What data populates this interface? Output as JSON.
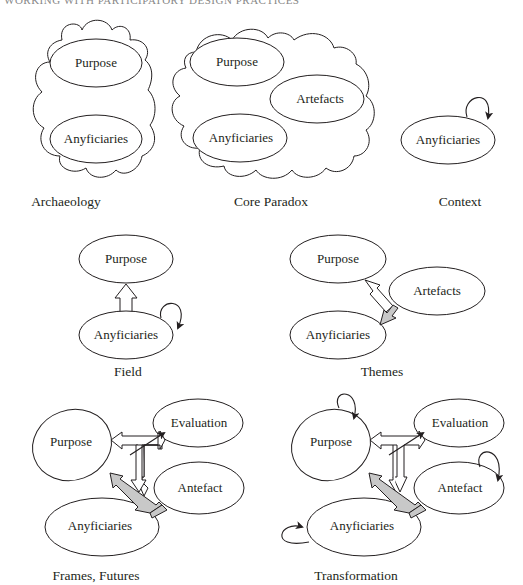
{
  "header": {
    "text": "WORKING WITH PARTICIPATORY DESIGN PRACTICES"
  },
  "diagrams": [
    {
      "id": "archaeology",
      "caption": "Archaeology",
      "nodes": [
        "Purpose",
        "Anyficiaries"
      ],
      "container": "cloud"
    },
    {
      "id": "core-paradox",
      "caption": "Core Paradox",
      "nodes": [
        "Purpose",
        "Artefacts",
        "Anyficiaries"
      ],
      "container": "cloud"
    },
    {
      "id": "context",
      "caption": "Context",
      "nodes": [
        "Anyficiaries"
      ],
      "self_loops": [
        "Anyficiaries"
      ]
    },
    {
      "id": "field",
      "caption": "Field",
      "nodes": [
        "Purpose",
        "Anyficiaries"
      ],
      "self_loops": [
        "Anyficiaries"
      ],
      "arrows": [
        {
          "from": "Anyficiaries",
          "to": "Purpose",
          "style": "hollow"
        }
      ]
    },
    {
      "id": "themes",
      "caption": "Themes",
      "nodes": [
        "Purpose",
        "Artefacts",
        "Anyficiaries"
      ],
      "arrows": [
        {
          "from": "Artefacts",
          "to": "Purpose",
          "style": "hollow"
        },
        {
          "from": "Artefacts",
          "to": "Anyficiaries",
          "style": "grey"
        }
      ]
    },
    {
      "id": "frames-futures",
      "caption": "Frames, Futures",
      "nodes": [
        "Purpose",
        "Evaluation",
        "Antefact",
        "Anyficiaries"
      ],
      "arrows": [
        {
          "from": "Purpose",
          "to": "Evaluation",
          "style": "hollow-double"
        },
        {
          "from": "Purpose-Evaluation",
          "to": "Antefact",
          "style": "hollow"
        },
        {
          "from": "Purpose",
          "to": "Antefact",
          "style": "grey-double"
        },
        {
          "from": "link",
          "to": "Evaluation",
          "style": "thin"
        }
      ]
    },
    {
      "id": "transformation",
      "caption": "Transformation",
      "nodes": [
        "Purpose",
        "Evaluation",
        "Antefact",
        "Anyficiaries"
      ],
      "self_loops": [
        "Purpose",
        "Antefact",
        "Anyficiaries"
      ],
      "arrows": [
        {
          "from": "Purpose",
          "to": "Evaluation",
          "style": "hollow-double"
        },
        {
          "from": "Purpose-Evaluation",
          "to": "Antefact",
          "style": "hollow"
        },
        {
          "from": "Purpose",
          "to": "Antefact",
          "style": "grey-double"
        },
        {
          "from": "link",
          "to": "Evaluation",
          "style": "thin"
        }
      ]
    }
  ]
}
